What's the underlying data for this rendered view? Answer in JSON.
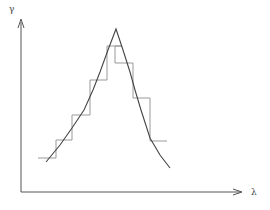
{
  "diagram": {
    "y_axis_label": "γ",
    "x_axis_label": "λ",
    "colors": {
      "axis": "#555555",
      "curve": "#444444",
      "steps": "#999999",
      "background": "#ffffff"
    },
    "curve_points": [
      [
        46,
        162
      ],
      [
        60,
        145
      ],
      [
        72,
        128
      ],
      [
        84,
        110
      ],
      [
        93,
        90
      ],
      [
        100,
        72
      ],
      [
        108,
        50
      ],
      [
        116,
        29
      ],
      [
        123,
        50
      ],
      [
        130,
        72
      ],
      [
        135,
        90
      ],
      [
        141,
        110
      ],
      [
        150,
        138
      ],
      [
        160,
        155
      ],
      [
        170,
        168
      ]
    ],
    "step_path": [
      [
        38,
        158
      ],
      [
        56,
        158
      ],
      [
        56,
        140
      ],
      [
        72,
        140
      ],
      [
        72,
        115
      ],
      [
        90,
        115
      ],
      [
        90,
        80
      ],
      [
        107,
        80
      ],
      [
        107,
        46
      ],
      [
        122,
        46
      ],
      [
        115,
        46
      ],
      [
        115,
        63
      ],
      [
        133,
        63
      ],
      [
        133,
        98
      ],
      [
        150,
        98
      ],
      [
        150,
        141
      ],
      [
        167,
        141
      ]
    ]
  }
}
